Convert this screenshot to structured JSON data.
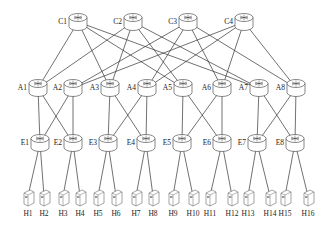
{
  "diagram": {
    "type": "fat-tree network topology",
    "colors": {
      "line": "#333333",
      "device_stroke": "#555555",
      "device_fill": "#ffffff"
    },
    "core": [
      {
        "id": "C1",
        "label": "C1",
        "x": 78,
        "y": 22
      },
      {
        "id": "C2",
        "label": "C2",
        "x": 133,
        "y": 22
      },
      {
        "id": "C3",
        "label": "C3",
        "x": 188,
        "y": 22
      },
      {
        "id": "C4",
        "label": "C4",
        "x": 244,
        "y": 22
      }
    ],
    "aggregation": [
      {
        "id": "A1",
        "label": "A1",
        "x": 38,
        "y": 88
      },
      {
        "id": "A2",
        "label": "A2",
        "x": 73,
        "y": 88
      },
      {
        "id": "A3",
        "label": "A3",
        "x": 110,
        "y": 88
      },
      {
        "id": "A4",
        "label": "A4",
        "x": 147,
        "y": 88
      },
      {
        "id": "A5",
        "label": "A5",
        "x": 183,
        "y": 88
      },
      {
        "id": "A6",
        "label": "A6",
        "x": 222,
        "y": 88
      },
      {
        "id": "A7",
        "label": "A7",
        "x": 259,
        "y": 88
      },
      {
        "id": "A8",
        "label": "A8",
        "x": 296,
        "y": 88
      }
    ],
    "edge": [
      {
        "id": "E1",
        "label": "E1",
        "x": 40,
        "y": 143
      },
      {
        "id": "E2",
        "label": "E2",
        "x": 73,
        "y": 143
      },
      {
        "id": "E3",
        "label": "E3",
        "x": 108,
        "y": 143
      },
      {
        "id": "E4",
        "label": "E4",
        "x": 146,
        "y": 143
      },
      {
        "id": "E5",
        "label": "E5",
        "x": 182,
        "y": 143
      },
      {
        "id": "E6",
        "label": "E6",
        "x": 222,
        "y": 143
      },
      {
        "id": "E7",
        "label": "E7",
        "x": 257,
        "y": 143
      },
      {
        "id": "E8",
        "label": "E8",
        "x": 295,
        "y": 143
      }
    ],
    "hosts": [
      {
        "id": "H1",
        "label": "H1",
        "x": 28
      },
      {
        "id": "H2",
        "label": "H2",
        "x": 44
      },
      {
        "id": "H3",
        "label": "H3",
        "x": 63
      },
      {
        "id": "H4",
        "label": "H4",
        "x": 80
      },
      {
        "id": "H5",
        "label": "H5",
        "x": 98
      },
      {
        "id": "H6",
        "label": "H6",
        "x": 116
      },
      {
        "id": "H7",
        "label": "H7",
        "x": 136
      },
      {
        "id": "H8",
        "label": "H8",
        "x": 153
      },
      {
        "id": "H9",
        "label": "H9",
        "x": 173
      },
      {
        "id": "H10",
        "label": "H10",
        "x": 193
      },
      {
        "id": "H11",
        "label": "H11",
        "x": 210
      },
      {
        "id": "H12",
        "label": "H12",
        "x": 232
      },
      {
        "id": "H13",
        "label": "H13",
        "x": 248
      },
      {
        "id": "H14",
        "label": "H14",
        "x": 270
      },
      {
        "id": "H15",
        "label": "H15",
        "x": 285
      },
      {
        "id": "H16",
        "label": "H16",
        "x": 308
      }
    ],
    "host_y": 196,
    "host_label_y": 216,
    "core_links": [
      [
        "C1",
        "A1"
      ],
      [
        "C1",
        "A3"
      ],
      [
        "C1",
        "A5"
      ],
      [
        "C1",
        "A7"
      ],
      [
        "C2",
        "A1"
      ],
      [
        "C2",
        "A3"
      ],
      [
        "C2",
        "A5"
      ],
      [
        "C2",
        "A7"
      ],
      [
        "C3",
        "A2"
      ],
      [
        "C3",
        "A4"
      ],
      [
        "C3",
        "A6"
      ],
      [
        "C3",
        "A8"
      ],
      [
        "C4",
        "A2"
      ],
      [
        "C4",
        "A4"
      ],
      [
        "C4",
        "A6"
      ],
      [
        "C4",
        "A8"
      ]
    ],
    "agg_links": [
      [
        "A1",
        "E1"
      ],
      [
        "A1",
        "E2"
      ],
      [
        "A2",
        "E1"
      ],
      [
        "A2",
        "E2"
      ],
      [
        "A3",
        "E3"
      ],
      [
        "A3",
        "E4"
      ],
      [
        "A4",
        "E3"
      ],
      [
        "A4",
        "E4"
      ],
      [
        "A5",
        "E5"
      ],
      [
        "A5",
        "E6"
      ],
      [
        "A6",
        "E5"
      ],
      [
        "A6",
        "E6"
      ],
      [
        "A7",
        "E7"
      ],
      [
        "A7",
        "E8"
      ],
      [
        "A8",
        "E7"
      ],
      [
        "A8",
        "E8"
      ]
    ],
    "host_links": [
      [
        "E1",
        "H1"
      ],
      [
        "E1",
        "H2"
      ],
      [
        "E2",
        "H3"
      ],
      [
        "E2",
        "H4"
      ],
      [
        "E3",
        "H5"
      ],
      [
        "E3",
        "H6"
      ],
      [
        "E4",
        "H7"
      ],
      [
        "E4",
        "H8"
      ],
      [
        "E5",
        "H9"
      ],
      [
        "E5",
        "H10"
      ],
      [
        "E6",
        "H11"
      ],
      [
        "E6",
        "H12"
      ],
      [
        "E7",
        "H13"
      ],
      [
        "E7",
        "H14"
      ],
      [
        "E8",
        "H15"
      ],
      [
        "E8",
        "H16"
      ]
    ]
  }
}
